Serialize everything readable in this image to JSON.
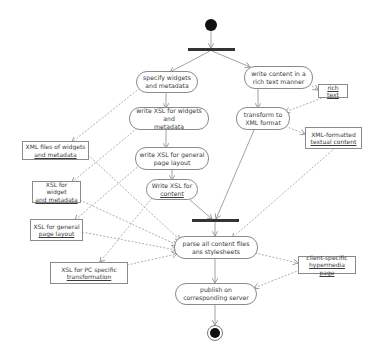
{
  "diagram": {
    "type": "UML activity diagram",
    "colors": {
      "line": "#8a8a8a",
      "bar": "#333333",
      "node": "#111111",
      "background": "#ffffff"
    },
    "start_node": {
      "label": ""
    },
    "end_node": {
      "label": ""
    },
    "actions": {
      "specify_widgets": {
        "line1": "specify widgets",
        "line2": "and metadata"
      },
      "write_content": {
        "line1": "write content in a",
        "line2": "rich text manner"
      },
      "write_xsl_widgets": {
        "line1": "write XSL for widgets and",
        "line2": "metadata"
      },
      "transform_xml": {
        "line1": "transform to",
        "line2": "XML format"
      },
      "write_xsl_layout": {
        "line1": "write XSL for general",
        "line2": "page layout"
      },
      "write_xsl_content": {
        "line1": "Write XSL for",
        "line2": "content"
      },
      "parse_all": {
        "line1": "parse all content files",
        "line2": "ans stylesheets"
      },
      "publish": {
        "line1": "publish on",
        "line2": "corresponding server"
      }
    },
    "objects": {
      "rich_text": {
        "line1": "rich text"
      },
      "xml_textual": {
        "line1": "XML-formatted",
        "line2": "textual content"
      },
      "xml_widgets": {
        "line1": "XML files of widgets",
        "line2": "and metadata"
      },
      "xsl_widget": {
        "line1": "XSL for widget",
        "line2": "and metadata"
      },
      "xsl_layout": {
        "line1": "XSL for general",
        "line2": "page layout"
      },
      "xsl_pc": {
        "line1": "XSL for PC specific",
        "line2": "transformation"
      },
      "client_page": {
        "line1": "client-specific",
        "line2": "hypermedia page"
      }
    }
  }
}
